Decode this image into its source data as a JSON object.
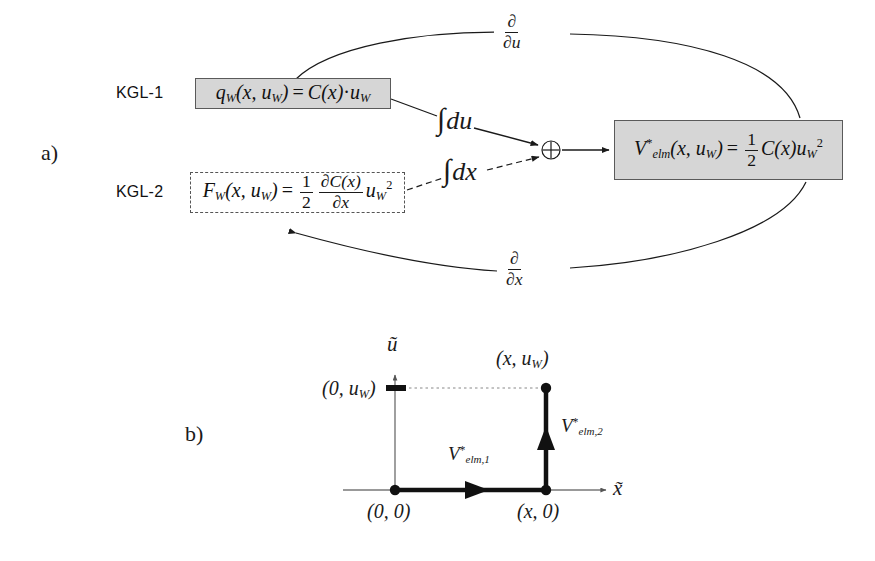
{
  "figure": {
    "panels": [
      {
        "id": "a",
        "label": "a)"
      },
      {
        "id": "b",
        "label": "b)"
      }
    ]
  },
  "panel_a": {
    "rows": [
      {
        "tag": "KGL-1"
      },
      {
        "tag": "KGL-2"
      }
    ],
    "boxes": {
      "kgl1": {
        "name": "charge-equation",
        "style": "shaded-solid",
        "lhs_fn": "q",
        "lhs_sub": "W",
        "args": "(x, u",
        "args_sub": "W",
        "args_close": ")",
        "equals": "=",
        "rhs_c": "C",
        "rhs_cx": "(x)",
        "rhs_dot": "·",
        "rhs_u": "u",
        "rhs_u_sub": "W",
        "plain": "q_W(x, u_W) = C(x) · u_W"
      },
      "kgl2": {
        "name": "force-equation",
        "style": "dashed",
        "lhs_fn": "F",
        "lhs_sub": "W",
        "args": "(x, u",
        "args_sub": "W",
        "args_close": ")",
        "equals": "=",
        "frac1_num": "1",
        "frac1_den": "2",
        "frac2_num": "∂C(x)",
        "frac2_den": "∂x",
        "tail_u": "u",
        "tail_sub": "W",
        "tail_sup": "2",
        "plain": "F_W(x, u_W) = 1/2 ∂C(x)/∂x u_W²"
      },
      "velm": {
        "name": "coenergy-equation",
        "style": "shaded-solid",
        "lhs_v": "V",
        "lhs_sup": "*",
        "lhs_sub": "elm",
        "args": "(x, u",
        "args_sub": "W",
        "args_close": ")",
        "equals": "=",
        "frac_num": "1",
        "frac_den": "2",
        "rhs_c": "C",
        "rhs_cx": "(x)",
        "rhs_u": "u",
        "rhs_u_sub": "W",
        "rhs_u_sup": "2",
        "plain": "V*_elm(x, u_W) = 1/2 C(x) u_W²"
      }
    },
    "operators": {
      "integral_du": {
        "symbol": "∫",
        "differential": "du",
        "linestyle": "solid"
      },
      "integral_dx": {
        "symbol": "∫",
        "differential": "dx",
        "linestyle": "dashed"
      },
      "sum_node": {
        "symbol": "⊕",
        "name": "summation-node"
      },
      "deriv_du": {
        "num": "∂",
        "den": "∂u",
        "linestyle": "solid"
      },
      "deriv_dx": {
        "num": "∂",
        "den": "∂x",
        "linestyle": "solid"
      }
    }
  },
  "panel_b": {
    "axes": {
      "x_label": "x̃",
      "y_label": "ũ"
    },
    "points": [
      {
        "name": "origin",
        "label": "(0, 0)"
      },
      {
        "name": "point-x-0",
        "label": "(x, 0)"
      },
      {
        "name": "point-x-uw",
        "label": "(x, u",
        "sub": "W",
        "close": ")",
        "plain": "(x, u_W)"
      },
      {
        "name": "tick-uw",
        "label": "(0, u",
        "sub": "W",
        "close": ")",
        "plain": "(0, u_W)"
      }
    ],
    "path_labels": [
      {
        "name": "segment-1",
        "v": "V",
        "sup": "*",
        "sub": "elm,1",
        "plain": "V*_elm,1"
      },
      {
        "name": "segment-2",
        "v": "V",
        "sup": "*",
        "sub": "elm,2",
        "plain": "V*_elm,2"
      }
    ]
  },
  "colors": {
    "box_fill": "#d6d6d6",
    "box_stroke": "#5a5a5a",
    "ink": "#1a1a1a",
    "axis": "#555555",
    "page_bg": "#ffffff"
  }
}
